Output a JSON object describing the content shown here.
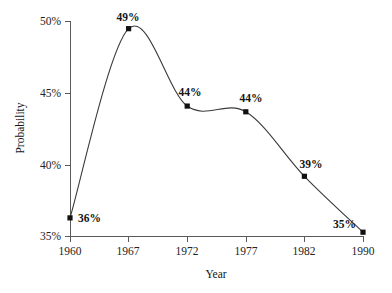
{
  "chart_data": {
    "type": "line",
    "title": "",
    "xlabel": "Year",
    "ylabel": "Probability",
    "categories": [
      "1960",
      "1967",
      "1972",
      "1977",
      "1982",
      "1990"
    ],
    "values": [
      36.3,
      49.5,
      44.1,
      43.7,
      39.2,
      35.3
    ],
    "point_labels": [
      "36%",
      "49%",
      "44%",
      "44%",
      "39%",
      "35%"
    ],
    "ytick_labels": [
      "35%",
      "40%",
      "45%",
      "50%"
    ],
    "ytick_values": [
      35,
      40,
      45,
      50
    ],
    "ylim": [
      34.85,
      50.2
    ],
    "grid": false,
    "legend": false,
    "interpolation": "smooth",
    "marker": "square",
    "line_color": "#3b3b3b",
    "marker_color": "#111111",
    "axis_color": "#5a5a5a",
    "background": "#ffffff"
  },
  "labels": {
    "y_axis_title": "Probability",
    "x_axis_title": "Year",
    "ytick_0": "35%",
    "ytick_1": "40%",
    "ytick_2": "45%",
    "ytick_3": "50%",
    "xtick_0": "1960",
    "xtick_1": "1967",
    "xtick_2": "1972",
    "xtick_3": "1977",
    "xtick_4": "1982",
    "xtick_5": "1990",
    "point_0": "36%",
    "point_1": "49%",
    "point_2": "44%",
    "point_3": "44%",
    "point_4": "39%",
    "point_5": "35%"
  }
}
